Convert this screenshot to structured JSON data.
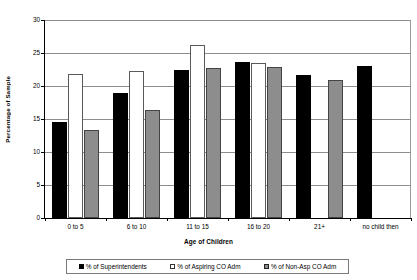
{
  "chart_data": {
    "type": "bar",
    "title": "",
    "xlabel": "Age of Children",
    "ylabel": "Percentage of Sample",
    "categories": [
      "0 to 5",
      "6 to 10",
      "11 to 15",
      "16 to 20",
      "21+",
      "no child then"
    ],
    "series": [
      {
        "name": "% of Superintendents",
        "color": "#000000",
        "values": [
          14.5,
          19.0,
          22.4,
          23.7,
          21.6,
          23.0
        ]
      },
      {
        "name": "% of Aspiring CO Adm",
        "color": "#ffffff",
        "values": [
          21.8,
          22.3,
          26.2,
          23.5,
          null,
          null
        ]
      },
      {
        "name": "% of Non-Asp CO Adm",
        "color": "#8d8d8d",
        "values": [
          13.3,
          16.4,
          22.8,
          22.9,
          20.9,
          null
        ]
      }
    ],
    "ylim": [
      0,
      30
    ],
    "yticks": [
      0,
      5,
      10,
      15,
      20,
      25,
      30
    ],
    "ytick_labels": [
      "0",
      "5",
      "10",
      "15",
      "20",
      "25",
      "30"
    ],
    "grid": true,
    "legend_position": "bottom"
  },
  "legend": {
    "items": [
      {
        "label": "% of Superintendents"
      },
      {
        "label": "% of Aspiring CO Adm"
      },
      {
        "label": "% of Non-Asp CO Adm"
      }
    ]
  }
}
